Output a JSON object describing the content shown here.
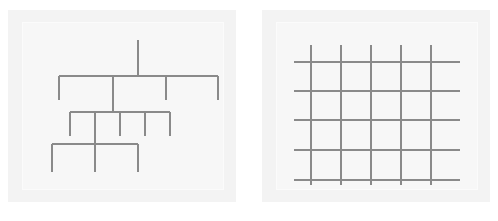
{
  "canvas": {
    "width": 498,
    "height": 221,
    "background": "#ffffff"
  },
  "style": {
    "stroke_color": "#8a8a8a",
    "stroke_width": 1.4,
    "panel_background": "#f3f3f3",
    "panel_inner_background": "#f7f7f7",
    "panel_inner_border": "#fbfbfb"
  },
  "panels": [
    {
      "name": "tree-diagram-panel",
      "label": "hierarchical tree diagram",
      "outer": {
        "x": 8,
        "y": 10,
        "width": 228,
        "height": 192
      },
      "inner": {
        "x": 22,
        "y": 22,
        "width": 202,
        "height": 168
      }
    },
    {
      "name": "grid-diagram-panel",
      "label": "line grid diagram",
      "outer": {
        "x": 262,
        "y": 10,
        "width": 228,
        "height": 192
      },
      "inner": {
        "x": 276,
        "y": 22,
        "width": 202,
        "height": 168
      }
    }
  ],
  "tree_diagram": {
    "name": "tree-diagram",
    "root_stem": {
      "x": 138,
      "y1": 40,
      "y2": 76
    },
    "levels": [
      {
        "name": "tree-level-1",
        "bar": {
          "y": 76,
          "x1": 59,
          "x2": 218
        },
        "drops": [
          {
            "x": 59,
            "y1": 76,
            "y2": 100
          },
          {
            "x": 113,
            "y1": 76,
            "y2": 112
          },
          {
            "x": 166,
            "y1": 76,
            "y2": 100
          },
          {
            "x": 218,
            "y1": 76,
            "y2": 100
          }
        ]
      },
      {
        "name": "tree-level-2",
        "bar": {
          "y": 112,
          "x1": 70,
          "x2": 170
        },
        "drops": [
          {
            "x": 70,
            "y1": 112,
            "y2": 136
          },
          {
            "x": 95,
            "y1": 112,
            "y2": 172
          },
          {
            "x": 120,
            "y1": 112,
            "y2": 136
          },
          {
            "x": 145,
            "y1": 112,
            "y2": 136
          },
          {
            "x": 170,
            "y1": 112,
            "y2": 136
          }
        ]
      },
      {
        "name": "tree-level-3",
        "bar": {
          "y": 144,
          "x1": 52,
          "x2": 138
        },
        "drops": [
          {
            "x": 52,
            "y1": 144,
            "y2": 172
          },
          {
            "x": 95,
            "y1": 144,
            "y2": 172
          },
          {
            "x": 138,
            "y1": 144,
            "y2": 172
          }
        ]
      }
    ]
  },
  "grid_diagram": {
    "name": "grid-diagram",
    "vertical_lines": [
      {
        "x": 311,
        "y1": 45,
        "y2": 185
      },
      {
        "x": 341,
        "y1": 45,
        "y2": 185
      },
      {
        "x": 371,
        "y1": 45,
        "y2": 185
      },
      {
        "x": 401,
        "y1": 45,
        "y2": 185
      },
      {
        "x": 431,
        "y1": 45,
        "y2": 185
      }
    ],
    "horizontal_lines": [
      {
        "y": 62,
        "x1": 294,
        "x2": 460
      },
      {
        "y": 91,
        "x1": 294,
        "x2": 460
      },
      {
        "y": 120,
        "x1": 294,
        "x2": 460
      },
      {
        "y": 150,
        "x1": 294,
        "x2": 460
      },
      {
        "y": 180,
        "x1": 294,
        "x2": 460
      }
    ]
  }
}
